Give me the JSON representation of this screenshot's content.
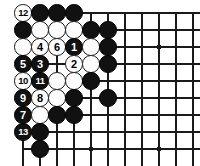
{
  "figure": {
    "kind": "go-board-diagram",
    "board_size_shown": {
      "cols": 11,
      "rows": 9
    },
    "colors": {
      "background": "#ffffff",
      "grid_line": "#1a1a1a",
      "black_stone": "#111111",
      "white_stone": "#fdfdfd",
      "stone_outline": "#1a1a1a",
      "black_label_text": "#ffffff",
      "white_label_text": "#000000"
    },
    "geometry": {
      "origin_x": 23,
      "origin_y": 13,
      "step": 17,
      "stone_diameter": 17.5,
      "cols": 11,
      "rows": 9
    }
  },
  "grid": {
    "left_edge_col": 1,
    "top_edge_row": 1,
    "horizontal_lines": 9,
    "vertical_lines": 11,
    "star_points": [
      {
        "col": 9,
        "row": 3
      },
      {
        "col": 5,
        "row": 9
      },
      {
        "col": 9,
        "row": 9
      }
    ]
  },
  "stones": [
    {
      "col": 1,
      "row": 1,
      "color": "white",
      "label": "12"
    },
    {
      "col": 2,
      "row": 1,
      "color": "black",
      "label": ""
    },
    {
      "col": 3,
      "row": 1,
      "color": "black",
      "label": ""
    },
    {
      "col": 4,
      "row": 1,
      "color": "black",
      "label": ""
    },
    {
      "col": 1,
      "row": 2,
      "color": "black",
      "label": ""
    },
    {
      "col": 2,
      "row": 2,
      "color": "white",
      "label": ""
    },
    {
      "col": 3,
      "row": 2,
      "color": "white",
      "label": ""
    },
    {
      "col": 4,
      "row": 2,
      "color": "white",
      "label": ""
    },
    {
      "col": 5,
      "row": 2,
      "color": "black",
      "label": ""
    },
    {
      "col": 6,
      "row": 2,
      "color": "black",
      "label": ""
    },
    {
      "col": 1,
      "row": 3,
      "color": "white",
      "label": ""
    },
    {
      "col": 2,
      "row": 3,
      "color": "white",
      "label": "4"
    },
    {
      "col": 3,
      "row": 3,
      "color": "white",
      "label": "6"
    },
    {
      "col": 4,
      "row": 3,
      "color": "black",
      "label": "1"
    },
    {
      "col": 5,
      "row": 3,
      "color": "white",
      "label": ""
    },
    {
      "col": 6,
      "row": 3,
      "color": "black",
      "label": ""
    },
    {
      "col": 1,
      "row": 4,
      "color": "black",
      "label": "5"
    },
    {
      "col": 2,
      "row": 4,
      "color": "black",
      "label": "3"
    },
    {
      "col": 4,
      "row": 4,
      "color": "white",
      "label": "2"
    },
    {
      "col": 5,
      "row": 4,
      "color": "white",
      "label": ""
    },
    {
      "col": 6,
      "row": 4,
      "color": "black",
      "label": ""
    },
    {
      "col": 1,
      "row": 5,
      "color": "white",
      "label": "10"
    },
    {
      "col": 2,
      "row": 5,
      "color": "black",
      "label": "11"
    },
    {
      "col": 3,
      "row": 5,
      "color": "white",
      "label": ""
    },
    {
      "col": 4,
      "row": 5,
      "color": "white",
      "label": ""
    },
    {
      "col": 5,
      "row": 5,
      "color": "black",
      "label": ""
    },
    {
      "col": 1,
      "row": 6,
      "color": "black",
      "label": "9"
    },
    {
      "col": 2,
      "row": 6,
      "color": "white",
      "label": "8"
    },
    {
      "col": 3,
      "row": 6,
      "color": "white",
      "label": ""
    },
    {
      "col": 4,
      "row": 6,
      "color": "black",
      "label": ""
    },
    {
      "col": 6,
      "row": 6,
      "color": "black",
      "label": ""
    },
    {
      "col": 1,
      "row": 7,
      "color": "black",
      "label": "7"
    },
    {
      "col": 2,
      "row": 7,
      "color": "white",
      "label": ""
    },
    {
      "col": 3,
      "row": 7,
      "color": "black",
      "label": ""
    },
    {
      "col": 4,
      "row": 7,
      "color": "black",
      "label": ""
    },
    {
      "col": 1,
      "row": 8,
      "color": "black",
      "label": "13"
    },
    {
      "col": 2,
      "row": 8,
      "color": "black",
      "label": ""
    },
    {
      "col": 2,
      "row": 9,
      "color": "black",
      "label": ""
    }
  ],
  "move_sequence": [
    {
      "number": "1",
      "color": "black"
    },
    {
      "number": "2",
      "color": "white"
    },
    {
      "number": "3",
      "color": "black"
    },
    {
      "number": "4",
      "color": "white"
    },
    {
      "number": "5",
      "color": "black"
    },
    {
      "number": "6",
      "color": "white"
    },
    {
      "number": "7",
      "color": "black"
    },
    {
      "number": "8",
      "color": "white"
    },
    {
      "number": "9",
      "color": "black"
    },
    {
      "number": "10",
      "color": "white"
    },
    {
      "number": "11",
      "color": "black"
    },
    {
      "number": "12",
      "color": "white"
    },
    {
      "number": "13",
      "color": "black"
    }
  ]
}
